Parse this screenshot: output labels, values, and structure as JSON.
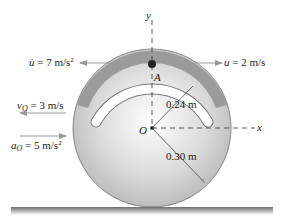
{
  "diagram": {
    "axes": {
      "y_label": "y",
      "x_label": "x"
    },
    "points": {
      "center": "O",
      "slider": "A"
    },
    "slider_motion": {
      "accel_symbol": "u̇",
      "accel_value": "= 7 m/s",
      "accel_exp": "2",
      "vel_symbol": "u",
      "vel_value": "= 2 m/s"
    },
    "center_motion": {
      "vel_symbol": "v",
      "vel_sub": "O",
      "vel_value": "= 3 m/s",
      "acc_symbol": "a",
      "acc_sub": "O",
      "acc_value": "= 5 m/s",
      "acc_exp": "2"
    },
    "dimensions": {
      "slot_radius": "0.24 m",
      "wheel_radius": "0.30 m"
    },
    "colors": {
      "ring": "#9a9a9a",
      "disk": "#d8d8d8",
      "arrow": "#9a9a9a",
      "ground": "#808080"
    }
  }
}
